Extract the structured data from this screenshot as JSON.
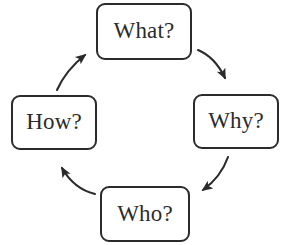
{
  "diagram": {
    "type": "cycle",
    "title": "",
    "background_color": "#ffffff",
    "stroke_color": "#2b2b2b",
    "text_color": "#2b2b2b",
    "nodes": [
      {
        "id": "what",
        "label": "What?",
        "position": "top"
      },
      {
        "id": "why",
        "label": "Why?",
        "position": "right"
      },
      {
        "id": "who",
        "label": "Who?",
        "position": "bottom"
      },
      {
        "id": "how",
        "label": "How?",
        "position": "left"
      }
    ],
    "arrows": [
      {
        "id": "what-to-why",
        "from": "what",
        "to": "why",
        "direction": "down-right",
        "style": "curved-solid-arrowhead"
      },
      {
        "id": "why-to-who",
        "from": "why",
        "to": "who",
        "direction": "down-left",
        "style": "curved-solid-arrowhead"
      },
      {
        "id": "who-to-how",
        "from": "who",
        "to": "how",
        "direction": "up-left",
        "style": "curved-solid-arrowhead"
      },
      {
        "id": "how-to-what",
        "from": "how",
        "to": "what",
        "direction": "up-right",
        "style": "curved-solid-arrowhead"
      }
    ]
  }
}
